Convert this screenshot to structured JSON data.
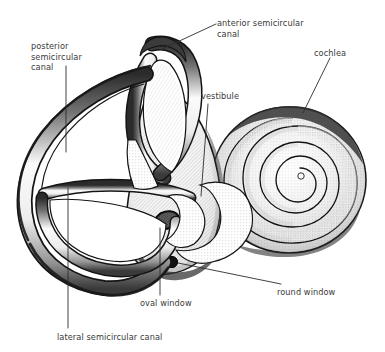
{
  "figure": {
    "background_color": "#ffffff",
    "ink_color": "#1a1a1a",
    "label_color": "#3a3a3a"
  },
  "labels": {
    "anterior_canal": "anterior semicircular\ncanal",
    "posterior_canal": "posterior\nsemicircular\ncanal",
    "cochlea": "cochlea",
    "vestibule": "vestibule",
    "round_window": "round window",
    "oval_window": "oval window",
    "lateral_canal": "lateral semicircular canal"
  },
  "structures": [
    {
      "name": "anterior-semicircular-canal",
      "label": "anterior semicircular canal",
      "description": "vertical loop at top center"
    },
    {
      "name": "posterior-semicircular-canal",
      "label": "posterior semicircular canal",
      "description": "large outer loop on the left"
    },
    {
      "name": "lateral-semicircular-canal",
      "label": "lateral semicircular canal",
      "description": "horizontal loop at lower left"
    },
    {
      "name": "vestibule",
      "label": "vestibule",
      "description": "stippled central chamber"
    },
    {
      "name": "cochlea",
      "label": "cochlea",
      "description": "spiral of about two and a half turns on the right"
    },
    {
      "name": "oval-window",
      "label": "oval window",
      "description": "dark ellipse on vestibule wall"
    },
    {
      "name": "round-window",
      "label": "round window",
      "description": "small dark circle below oval window"
    }
  ],
  "leader_lines": [
    {
      "name": "leader-anterior-canal",
      "from": [
        216,
        24
      ],
      "to": [
        160,
        50
      ]
    },
    {
      "name": "leader-posterior-canal",
      "from": [
        66,
        66
      ],
      "to": [
        66,
        152
      ]
    },
    {
      "name": "leader-cochlea",
      "from": [
        330,
        58
      ],
      "to": [
        303,
        113
      ]
    },
    {
      "name": "leader-vestibule",
      "from": [
        208,
        104
      ],
      "to": [
        201,
        196
      ]
    },
    {
      "name": "leader-round-window",
      "from": [
        178,
        263
      ],
      "to": [
        281,
        284
      ]
    },
    {
      "name": "leader-oval-window",
      "from": [
        160,
        228
      ],
      "to": [
        160,
        295
      ]
    },
    {
      "name": "leader-lateral-canal",
      "from": [
        68,
        188
      ],
      "to": [
        68,
        328
      ]
    }
  ]
}
